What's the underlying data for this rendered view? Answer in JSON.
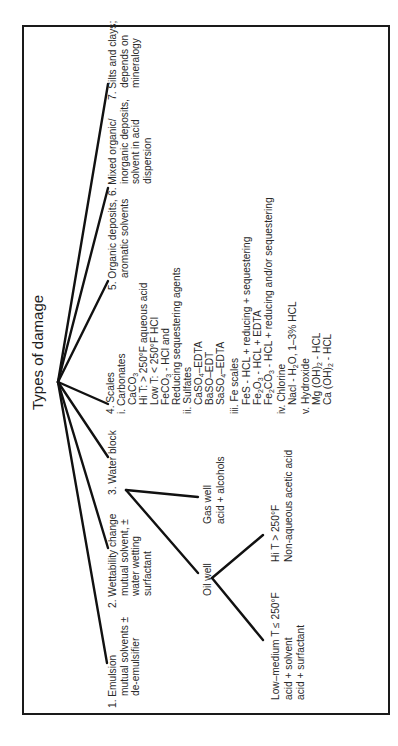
{
  "title": "Types of damage",
  "branches": [
    {
      "id": "1",
      "lines": [
        "1. Emulsion",
        "mutual solvents ±",
        "de-emulsifier"
      ]
    },
    {
      "id": "2",
      "lines": [
        "2. Wettability change",
        "mutual solvent, ±",
        "water wetting",
        "surfactant"
      ]
    },
    {
      "id": "3",
      "lines": [
        "3. Water block"
      ],
      "children": [
        {
          "label": "Gas well",
          "lines": [
            "acid + alcohols"
          ]
        },
        {
          "label": "Oil well",
          "children": [
            {
              "lines": [
                "Hi T > 250°F",
                "Non-aqueous acetic acid"
              ]
            },
            {
              "lines": [
                "Low–medium T ≤ 250°F",
                "acid + solvent",
                "acid + surfactant"
              ]
            }
          ]
        }
      ]
    },
    {
      "id": "4",
      "label": "4. Scales",
      "groups": [
        {
          "label": "i. Carbonates",
          "items": [
            "CaCO3",
            "Hi T: > 250°F aqueous acid",
            "Low T: < 250°F HCl",
            "FeCO3 - HCl and",
            "Reducing sequestering agents"
          ]
        },
        {
          "label": "ii. Sulfates",
          "items": [
            "CaSO4–EDTA",
            "BaSO–EDT",
            "SaSO4–EDTA"
          ]
        },
        {
          "label": "iii. Fe scales",
          "items": [
            "FeS - HCL + reducing + sequestering",
            "Fe2O3 - HCL + EDTA",
            "Fe2CO3 - HCL + reducing and/or sequestering"
          ]
        },
        {
          "label": "iv. Chlorine",
          "items": [
            "Nacl - H2O, 1–3% HCL"
          ]
        },
        {
          "label": "v. Hydroxide",
          "items": [
            "Mg (OH)2 - HCL",
            "Ca (OH)2 - HCL"
          ]
        }
      ]
    },
    {
      "id": "5",
      "lines": [
        "5. Organic deposits,",
        "aromatic solvents"
      ]
    },
    {
      "id": "6",
      "lines": [
        "6. Mixed organic/",
        "inorganic deposits,",
        "solvent in acid",
        "dispersion"
      ]
    },
    {
      "id": "7",
      "lines": [
        "7. Silts and clays;",
        "depends on",
        "mineralogy"
      ]
    }
  ],
  "formula_parts": {
    "caco3": [
      "CaCO",
      "3"
    ],
    "feco3": [
      "FeCO",
      "3",
      " - HCl and"
    ],
    "caso4": [
      "CaSO",
      "4",
      "–EDTA"
    ],
    "saso4": [
      "SaSO",
      "4",
      "–EDTA"
    ],
    "fe2o3": [
      "Fe",
      "2",
      "O",
      "3",
      " - HCL + EDTA"
    ],
    "fe2co3": [
      "Fe",
      "2",
      "CO",
      "3",
      " - HCL + reducing and/or sequestering"
    ],
    "nacl": [
      "Nacl - H",
      "2",
      "O, 1–3% HCL"
    ],
    "mg": [
      "Mg (OH)",
      "2",
      " - HCL"
    ],
    "ca": [
      "Ca (OH)",
      "2",
      " - HCL"
    ]
  },
  "colors": {
    "line": "#111111",
    "text": "#2a2a2a",
    "border": "#1a1a1a",
    "background": "#ffffff"
  }
}
